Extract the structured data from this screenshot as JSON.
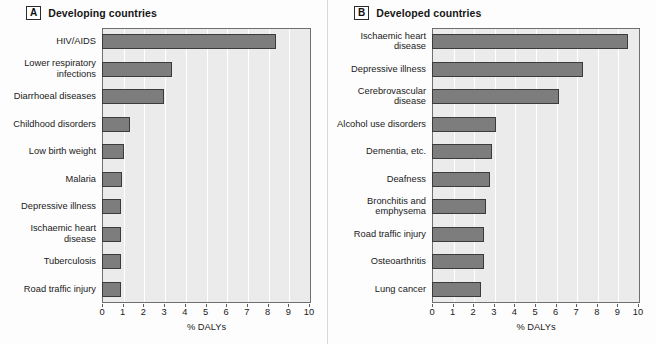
{
  "figure": {
    "panels": [
      {
        "letter": "A",
        "title": "Developing countries",
        "axis_title": "% DALYs",
        "tick_labels": [
          "0",
          "1",
          "2",
          "3",
          "4",
          "5",
          "6",
          "7",
          "8",
          "9",
          "10"
        ]
      },
      {
        "letter": "B",
        "title": "Developed countries",
        "axis_title": "% DALYs",
        "tick_labels": [
          "0",
          "1",
          "2",
          "3",
          "4",
          "5",
          "6",
          "7",
          "8",
          "9",
          "10"
        ]
      }
    ]
  },
  "chart_data": [
    {
      "type": "bar",
      "orientation": "horizontal",
      "title": "Developing countries",
      "panel_letter": "A",
      "xlabel": "% DALYs",
      "ylabel": "",
      "xlim": [
        0,
        10
      ],
      "xticks": [
        0,
        1,
        2,
        3,
        4,
        5,
        6,
        7,
        8,
        9,
        10
      ],
      "grid": true,
      "legend": "none",
      "bar_color": "#7d7d7d",
      "bar_edge_color": "#3b3b3b",
      "plot_background": "#ebebeb",
      "categories": [
        "HIV/AIDS",
        "Lower respiratory infections",
        "Diarrhoeal diseases",
        "Childhood disorders",
        "Low birth weight",
        "Malaria",
        "Depressive illness",
        "Ischaemic heart disease",
        "Tuberculosis",
        "Road traffic injury"
      ],
      "category_lines": [
        [
          "HIV/AIDS"
        ],
        [
          "Lower respiratory",
          "infections"
        ],
        [
          "Diarrhoeal diseases"
        ],
        [
          "Childhood disorders"
        ],
        [
          "Low birth weight"
        ],
        [
          "Malaria"
        ],
        [
          "Depressive illness"
        ],
        [
          "Ischaemic heart",
          "disease"
        ],
        [
          "Tuberculosis"
        ],
        [
          "Road traffic injury"
        ]
      ],
      "values": [
        8.4,
        3.4,
        3.0,
        1.35,
        1.05,
        0.95,
        0.9,
        0.9,
        0.9,
        0.9
      ]
    },
    {
      "type": "bar",
      "orientation": "horizontal",
      "title": "Developed countries",
      "panel_letter": "B",
      "xlabel": "% DALYs",
      "ylabel": "",
      "xlim": [
        0,
        10
      ],
      "xticks": [
        0,
        1,
        2,
        3,
        4,
        5,
        6,
        7,
        8,
        9,
        10
      ],
      "grid": true,
      "legend": "none",
      "bar_color": "#7d7d7d",
      "bar_edge_color": "#3b3b3b",
      "plot_background": "#ebebeb",
      "categories": [
        "Ischaemic heart disease",
        "Depressive illness",
        "Cerebrovascular disease",
        "Alcohol use disorders",
        "Dementia, etc.",
        "Deafness",
        "Bronchitis and emphysema",
        "Road traffic injury",
        "Osteoarthritis",
        "Lung cancer"
      ],
      "category_lines": [
        [
          "Ischaemic heart",
          "disease"
        ],
        [
          "Depressive illness"
        ],
        [
          "Cerebrovascular",
          "disease"
        ],
        [
          "Alcohol use disorders"
        ],
        [
          "Dementia, etc."
        ],
        [
          "Deafness"
        ],
        [
          "Bronchitis and",
          "emphysema"
        ],
        [
          "Road traffic injury"
        ],
        [
          "Osteoarthritis"
        ],
        [
          "Lung cancer"
        ]
      ],
      "values": [
        9.5,
        7.35,
        6.15,
        3.1,
        2.9,
        2.8,
        2.6,
        2.5,
        2.5,
        2.4
      ]
    }
  ]
}
